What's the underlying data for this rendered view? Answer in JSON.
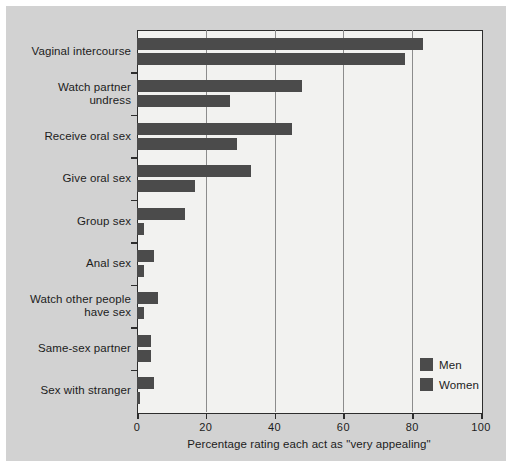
{
  "chart_data": {
    "type": "bar",
    "orientation": "horizontal",
    "title": "",
    "subtitle": "",
    "xlabel": "Percentage rating each act as \"very appealing\"",
    "ylabel": "",
    "xlim": [
      0,
      100
    ],
    "xticks": [
      0,
      20,
      40,
      60,
      80,
      100
    ],
    "xticklabels": [
      "0",
      "20",
      "40",
      "60",
      "80",
      "100"
    ],
    "grid": true,
    "grid_axis": "x",
    "legend_position": "lower-right",
    "categories": [
      "Vaginal intercourse",
      "Watch partner undress",
      "Receive oral sex",
      "Give oral sex",
      "Group sex",
      "Anal sex",
      "Watch other people have sex",
      "Same-sex partner",
      "Sex with stranger"
    ],
    "series": [
      {
        "name": "Men",
        "color": "#4b4b4b",
        "values": [
          83,
          48,
          45,
          33,
          14,
          5,
          6,
          4,
          5
        ]
      },
      {
        "name": "Women",
        "color": "#4b4b4b",
        "values": [
          78,
          27,
          29,
          17,
          2,
          2,
          2,
          4,
          1
        ]
      }
    ]
  },
  "legend": {
    "items": [
      {
        "label": "Men",
        "color": "#4b4b4b"
      },
      {
        "label": "Women",
        "color": "#4b4b4b"
      }
    ]
  },
  "category_lines": [
    [
      "Vaginal intercourse"
    ],
    [
      "Watch partner",
      "undress"
    ],
    [
      "Receive oral sex"
    ],
    [
      "Give oral sex"
    ],
    [
      "Group sex"
    ],
    [
      "Anal sex"
    ],
    [
      "Watch other people",
      "have sex"
    ],
    [
      "Same-sex partner"
    ],
    [
      "Sex with stranger"
    ]
  ],
  "colors": {
    "bar": "#4b4b4b",
    "panel_background": "#d2d2d2",
    "plot_background": "#f2f2f0",
    "axis": "#2d2d2d",
    "gridline": "#8c8c8c",
    "text": "#1c1c1c"
  }
}
